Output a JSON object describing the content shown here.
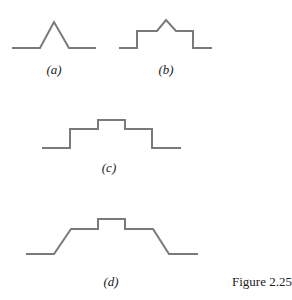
{
  "figure": {
    "caption": "Figure 2.25",
    "stroke_color": "#7a7a7a",
    "panels": [
      {
        "id": "a",
        "label": "(a)",
        "description": "triangular pulse",
        "points": [
          [
            12,
            48
          ],
          [
            40,
            48
          ],
          [
            54,
            22
          ],
          [
            69,
            48
          ],
          [
            96,
            48
          ]
        ],
        "label_pos": [
          54,
          62
        ]
      },
      {
        "id": "b",
        "label": "(b)",
        "description": "step up, triangular peak, step down",
        "points": [
          [
            119,
            48
          ],
          [
            137,
            48
          ],
          [
            137,
            31
          ],
          [
            157,
            31
          ],
          [
            166,
            20
          ],
          [
            176,
            31
          ],
          [
            193,
            31
          ],
          [
            193,
            48
          ],
          [
            212,
            48
          ]
        ],
        "label_pos": [
          166,
          62
        ]
      },
      {
        "id": "c",
        "label": "(c)",
        "description": "two-level staircase pulse",
        "points": [
          [
            42,
            148
          ],
          [
            70,
            148
          ],
          [
            70,
            129
          ],
          [
            98,
            129
          ],
          [
            98,
            120
          ],
          [
            125,
            120
          ],
          [
            125,
            129
          ],
          [
            152,
            129
          ],
          [
            152,
            148
          ],
          [
            181,
            148
          ]
        ],
        "label_pos": [
          109,
          160
        ]
      },
      {
        "id": "d",
        "label": "(d)",
        "description": "sloped ramps with stepped top",
        "points": [
          [
            26,
            254
          ],
          [
            54,
            254
          ],
          [
            71,
            229
          ],
          [
            98,
            229
          ],
          [
            98,
            219
          ],
          [
            125,
            219
          ],
          [
            125,
            229
          ],
          [
            153,
            229
          ],
          [
            169,
            254
          ],
          [
            198,
            254
          ]
        ],
        "label_pos": [
          111,
          274
        ]
      }
    ]
  }
}
